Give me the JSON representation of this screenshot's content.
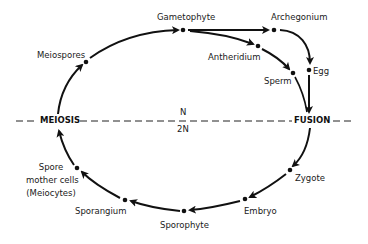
{
  "diagram": {
    "type": "life-cycle",
    "ploidy_line": {
      "left_event": "MEIOSIS",
      "right_event": "FUSION",
      "upper_label": "N",
      "lower_label": "2N"
    },
    "stages": {
      "meiospores": "Meiospores",
      "gametophyte": "Gametophyte",
      "archegonium": "Archegonium",
      "antheridium": "Antheridium",
      "egg": "Egg",
      "sperm": "Sperm",
      "zygote": "Zygote",
      "embryo": "Embryo",
      "sporophyte": "Sporophyte",
      "sporangium": "Sporangium",
      "spore_mother_cells": [
        "Spore",
        "mother cells",
        "(Meiocytes)"
      ]
    },
    "edges": [
      [
        "MEIOSIS",
        "Meiospores"
      ],
      [
        "Meiospores",
        "Gametophyte"
      ],
      [
        "Gametophyte",
        "Archegonium"
      ],
      [
        "Gametophyte",
        "Antheridium"
      ],
      [
        "Archegonium",
        "Egg"
      ],
      [
        "Antheridium",
        "Sperm"
      ],
      [
        "Egg",
        "FUSION"
      ],
      [
        "Sperm",
        "FUSION"
      ],
      [
        "FUSION",
        "Zygote"
      ],
      [
        "Zygote",
        "Embryo"
      ],
      [
        "Embryo",
        "Sporophyte"
      ],
      [
        "Sporophyte",
        "Sporangium"
      ],
      [
        "Sporangium",
        "Spore mother cells (Meiocytes)"
      ],
      [
        "Spore mother cells (Meiocytes)",
        "MEIOSIS"
      ]
    ]
  }
}
